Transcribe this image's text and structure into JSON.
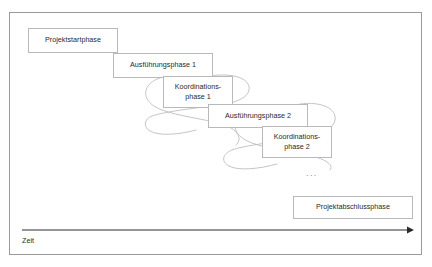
{
  "diagram": {
    "frame": {
      "border_color": "#9a9a9a",
      "background": "#ffffff"
    },
    "box_border_color": "#b9b9b9",
    "loop_color": "#bdbdbd",
    "axis_color": "#2a2a2a",
    "text_color": "#2a2a2a",
    "phases": [
      {
        "id": "projektstartphase",
        "label": "Projektstartphase",
        "x": 28,
        "y": 28,
        "w": 90,
        "h": 25
      },
      {
        "id": "ausfuehrungsphase-1",
        "label": "Ausführungsphase 1",
        "x": 113,
        "y": 53,
        "w": 100,
        "h": 25
      },
      {
        "id": "koordinationsphase-1",
        "label": "Koordinations-\nphase 1",
        "x": 163,
        "y": 76,
        "w": 70,
        "h": 32
      },
      {
        "id": "ausfuehrungsphase-2",
        "label": "Ausführungsphase 2",
        "x": 208,
        "y": 104,
        "w": 100,
        "h": 24
      },
      {
        "id": "koordinationsphase-2",
        "label": "Koordinations-\nphase 2",
        "x": 262,
        "y": 126,
        "w": 70,
        "h": 32
      },
      {
        "id": "projektabschlussphase",
        "label": "Projektabschlussphase",
        "x": 293,
        "y": 196,
        "w": 120,
        "h": 23
      }
    ],
    "loops": [
      {
        "id": "iteration-loop-1",
        "around": "koordinationsphase-1"
      },
      {
        "id": "iteration-loop-2",
        "around": "koordinationsphase-2"
      }
    ],
    "continuation": {
      "id": "continuation-ellipsis",
      "label": "..."
    },
    "time_axis": {
      "id": "zeit-axis",
      "label": "Zeit",
      "direction": "left-to-right"
    }
  }
}
